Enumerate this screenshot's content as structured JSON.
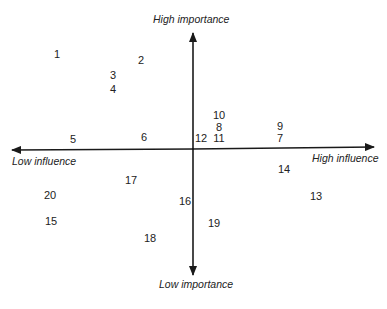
{
  "diagram": {
    "title": "",
    "type": "quadrant-matrix",
    "axes": {
      "vertical": {
        "top_label": "High importance",
        "bottom_label": "Low importance"
      },
      "horizontal": {
        "left_label": "Low influence",
        "right_label": "High influence"
      }
    },
    "points": [
      {
        "label": "1",
        "x": 57,
        "y": 54
      },
      {
        "label": "2",
        "x": 141,
        "y": 60
      },
      {
        "label": "3",
        "x": 113,
        "y": 75
      },
      {
        "label": "4",
        "x": 113,
        "y": 89
      },
      {
        "label": "5",
        "x": 73,
        "y": 139
      },
      {
        "label": "6",
        "x": 144,
        "y": 137
      },
      {
        "label": "7",
        "x": 280,
        "y": 138
      },
      {
        "label": "8",
        "x": 219,
        "y": 127
      },
      {
        "label": "9",
        "x": 280,
        "y": 126
      },
      {
        "label": "10",
        "x": 219,
        "y": 115
      },
      {
        "label": "11",
        "x": 219,
        "y": 138
      },
      {
        "label": "12",
        "x": 201,
        "y": 138
      },
      {
        "label": "13",
        "x": 316,
        "y": 196
      },
      {
        "label": "14",
        "x": 284,
        "y": 169
      },
      {
        "label": "15",
        "x": 51,
        "y": 221
      },
      {
        "label": "16",
        "x": 185,
        "y": 201
      },
      {
        "label": "17",
        "x": 131,
        "y": 180
      },
      {
        "label": "18",
        "x": 150,
        "y": 238
      },
      {
        "label": "19",
        "x": 214,
        "y": 223
      },
      {
        "label": "20",
        "x": 50,
        "y": 195
      }
    ],
    "colors": {
      "axis": "#1a1a1a",
      "text": "#222222",
      "background": "#ffffff"
    }
  }
}
